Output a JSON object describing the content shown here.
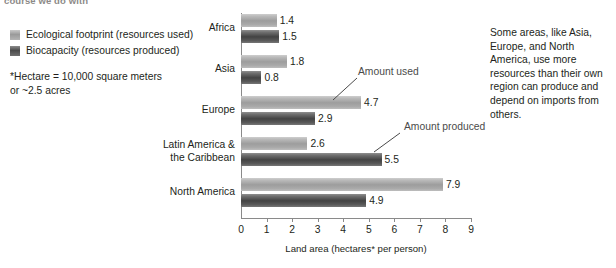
{
  "cropped_head": "course we do with",
  "legend": {
    "items": [
      {
        "label": "Ecological footprint (resources used)",
        "swatch": "light-gradient-swatch",
        "color": "#9d9d9d"
      },
      {
        "label": "Biocapacity (resources produced)",
        "swatch": "dark-gradient-swatch",
        "color": "#434343"
      }
    ]
  },
  "footnote": {
    "line1": "*Hectare = 10,000 square meters",
    "line2": "or ~2.5 acres"
  },
  "annotations": {
    "amount_used": "Amount used",
    "amount_produced": "Amount produced"
  },
  "side_note": "Some areas, like Asia, Europe, and North America, use more resources than their own region can produce and depend on imports from others.",
  "chart_data": {
    "type": "bar",
    "orientation": "horizontal",
    "title": "",
    "xlabel": "Land area (hectares* per person)",
    "ylabel": "",
    "xlim": [
      0,
      9
    ],
    "xticks": [
      0,
      1,
      2,
      3,
      4,
      5,
      6,
      7,
      8,
      9
    ],
    "grid": false,
    "legend_position": "left-outside",
    "categories": [
      "Africa",
      "Asia",
      "Europe",
      "Latin America & the Caribbean",
      "North America"
    ],
    "category_lines": [
      [
        "Africa"
      ],
      [
        "Asia"
      ],
      [
        "Europe"
      ],
      [
        "Latin America &",
        "the Caribbean"
      ],
      [
        "North America"
      ]
    ],
    "series": [
      {
        "name": "Ecological footprint (resources used)",
        "values": [
          1.4,
          1.8,
          4.7,
          2.6,
          7.9
        ],
        "color": "#9d9d9d"
      },
      {
        "name": "Biocapacity (resources produced)",
        "values": [
          1.5,
          0.8,
          2.9,
          5.5,
          4.9
        ],
        "color": "#434343"
      }
    ]
  }
}
